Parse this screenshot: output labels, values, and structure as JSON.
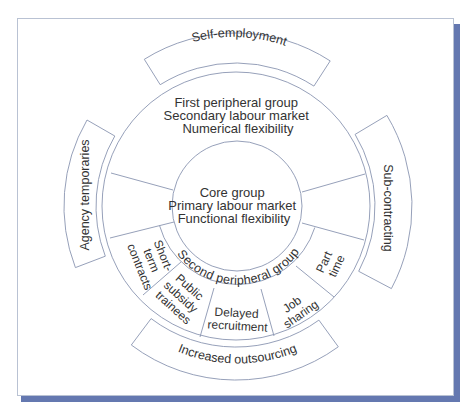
{
  "diagram": {
    "type": "flexible-firm-model",
    "core": {
      "lines": [
        "Core group",
        "Primary labour market",
        "Functional flexibility"
      ]
    },
    "first_peripheral": {
      "lines": [
        "First peripheral group",
        "Secondary labour market",
        "Numerical flexibility"
      ]
    },
    "second_peripheral": {
      "label": "Second peripheral group",
      "segments": [
        {
          "id": "short-term-contracts",
          "lines": [
            "Short-",
            "term",
            "contracts"
          ]
        },
        {
          "id": "public-subsidy-trainees",
          "lines": [
            "Public",
            "subsidy",
            "trainees"
          ]
        },
        {
          "id": "delayed-recruitment",
          "lines": [
            "Delayed",
            "recruitment"
          ]
        },
        {
          "id": "job-sharing",
          "lines": [
            "Job",
            "sharing"
          ]
        },
        {
          "id": "part-time",
          "lines": [
            "Part",
            "time"
          ]
        }
      ]
    },
    "external_bands": [
      {
        "id": "self-employment",
        "label": "Self-employment",
        "position": "top"
      },
      {
        "id": "sub-contracting",
        "label": "Sub-contracting",
        "position": "right"
      },
      {
        "id": "increased-outsourcing",
        "label": "Increased outsourcing",
        "position": "bottom"
      },
      {
        "id": "agency-temporaries",
        "label": "Agency temporaries",
        "position": "left"
      }
    ]
  },
  "colors": {
    "line": "#8a95b1",
    "text": "#333333",
    "frame_border": "#b9c2d3",
    "frame_shadow": "#6478b0"
  }
}
